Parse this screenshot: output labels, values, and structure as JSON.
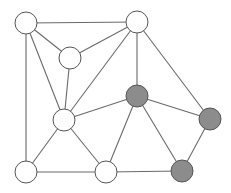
{
  "diagram": {
    "type": "graph",
    "width": 231,
    "height": 193,
    "node_radius": 11,
    "colors": {
      "background": "#ffffff",
      "edge": "#6a6a6a",
      "node_stroke": "#555555",
      "node_fill_default": "#ffffff",
      "node_fill_highlight": "#8c8c8c"
    },
    "nodes": [
      {
        "id": "A",
        "x": 26,
        "y": 23,
        "highlighted": false
      },
      {
        "id": "B",
        "x": 137,
        "y": 22,
        "highlighted": false
      },
      {
        "id": "C",
        "x": 70,
        "y": 58,
        "highlighted": false
      },
      {
        "id": "D",
        "x": 64,
        "y": 120,
        "highlighted": false
      },
      {
        "id": "E",
        "x": 26,
        "y": 172,
        "highlighted": false
      },
      {
        "id": "F",
        "x": 106,
        "y": 172,
        "highlighted": false
      },
      {
        "id": "G",
        "x": 137,
        "y": 96,
        "highlighted": true
      },
      {
        "id": "H",
        "x": 210,
        "y": 119,
        "highlighted": true
      },
      {
        "id": "I",
        "x": 182,
        "y": 171,
        "highlighted": true
      }
    ],
    "edges": [
      [
        "A",
        "B"
      ],
      [
        "A",
        "C"
      ],
      [
        "A",
        "D"
      ],
      [
        "A",
        "E"
      ],
      [
        "B",
        "C"
      ],
      [
        "B",
        "D"
      ],
      [
        "B",
        "G"
      ],
      [
        "B",
        "H"
      ],
      [
        "C",
        "D"
      ],
      [
        "D",
        "G"
      ],
      [
        "D",
        "E"
      ],
      [
        "D",
        "F"
      ],
      [
        "E",
        "F"
      ],
      [
        "F",
        "G"
      ],
      [
        "F",
        "I"
      ],
      [
        "G",
        "H"
      ],
      [
        "G",
        "I"
      ],
      [
        "H",
        "I"
      ]
    ]
  }
}
